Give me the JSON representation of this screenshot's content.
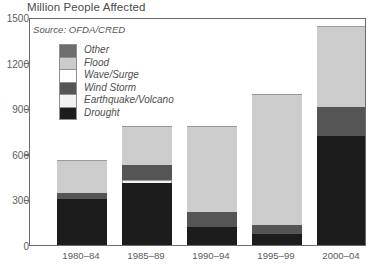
{
  "chart_data": {
    "type": "bar",
    "subtype": "stacked-vertical",
    "title": "Million People Affected",
    "xlabel": "",
    "ylabel": "",
    "source": "Source: OFDA/CRED",
    "ylim": [
      0,
      1500
    ],
    "yticks": [
      0,
      300,
      600,
      900,
      1200,
      1500
    ],
    "ytick_labels": [
      "0",
      "300",
      "600",
      "900",
      "1200",
      "1500"
    ],
    "grid": false,
    "legend_position": "inside-upper-left",
    "categories": [
      "1980–84",
      "1985–89",
      "1990–94",
      "1995–99",
      "2000–04"
    ],
    "series": [
      {
        "name": "Drought",
        "color": "#1c1c1c",
        "values": [
          300,
          405,
          120,
          70,
          715
        ]
      },
      {
        "name": "Earthquake/Volcano",
        "color": "#f2f2f2",
        "values": [
          0,
          20,
          0,
          0,
          0
        ]
      },
      {
        "name": "Wind Storm",
        "color": "#555555",
        "values": [
          40,
          100,
          100,
          65,
          195
        ]
      },
      {
        "name": "Wave/Surge",
        "color": "#ffffff",
        "values": [
          0,
          0,
          0,
          0,
          0
        ]
      },
      {
        "name": "Flood",
        "color": "#cccccc",
        "values": [
          220,
          260,
          565,
          860,
          530
        ]
      },
      {
        "name": "Other",
        "color": "#6e6e6e",
        "values": [
          0,
          0,
          0,
          0,
          0
        ]
      }
    ],
    "totals": [
      560,
      785,
      785,
      995,
      1440
    ]
  },
  "legend": {
    "items": [
      {
        "label": "Other",
        "color": "#6e6e6e"
      },
      {
        "label": "Flood",
        "color": "#cccccc"
      },
      {
        "label": "Wave/Surge",
        "color": "#ffffff"
      },
      {
        "label": "Wind Storm",
        "color": "#555555"
      },
      {
        "label": "Earthquake/Volcano",
        "color": "#f2f2f2"
      },
      {
        "label": "Drought",
        "color": "#1c1c1c"
      }
    ]
  },
  "caption": {
    "partial_text": ""
  },
  "style": {
    "frame_color": "#6b6b6b",
    "text_color": "#4c4c4c"
  }
}
